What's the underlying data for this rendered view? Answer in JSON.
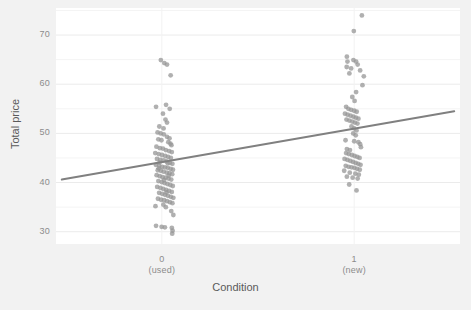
{
  "chart_data": {
    "type": "scatter",
    "title": "",
    "xlabel": "Condition",
    "ylabel": "Total price",
    "xlim": [
      -0.55,
      1.55
    ],
    "ylim": [
      27.5,
      75.5
    ],
    "ylim_visible": [
      30,
      70
    ],
    "grid": true,
    "grid_major_y": [
      30,
      40,
      50,
      60,
      70
    ],
    "grid_minor_y": [
      35,
      45,
      55,
      65,
      75
    ],
    "legend": "none",
    "x_categories": [
      {
        "value": 0,
        "label": "0",
        "sublabel": "(used)"
      },
      {
        "value": 1,
        "label": "1",
        "sublabel": "(new)"
      }
    ],
    "y_ticks": [
      30,
      40,
      50,
      60,
      70
    ],
    "point_color": "#969696",
    "point_opacity": 0.75,
    "point_radius": 2.4,
    "line_color": "#808080",
    "line_width": 2,
    "panel_background": "#ffffff",
    "outer_background": "#f2f2f2",
    "axis_text_color": "#8c8c8c",
    "axis_title_color": "#5a5a5a",
    "regression_line": {
      "x_start": -0.52,
      "y_start": 40.6,
      "x_end": 1.52,
      "y_end": 54.5,
      "jittered": true
    },
    "series": [
      {
        "name": "used",
        "x_center": 0,
        "jitter_width": 0.09,
        "points": [
          [
            -0.005,
            64.9
          ],
          [
            0.013,
            64.3
          ],
          [
            0.027,
            64.0
          ],
          [
            0.046,
            61.8
          ],
          [
            -0.03,
            55.4
          ],
          [
            0.022,
            55.8
          ],
          [
            0.041,
            55.0
          ],
          [
            0.006,
            54.0
          ],
          [
            0.019,
            52.8
          ],
          [
            0.027,
            52.2
          ],
          [
            -0.013,
            51.4
          ],
          [
            0.009,
            51.0
          ],
          [
            -0.022,
            50.2
          ],
          [
            -0.006,
            50.0
          ],
          [
            0.01,
            49.8
          ],
          [
            0.027,
            49.3
          ],
          [
            0.04,
            49.0
          ],
          [
            -0.018,
            48.8
          ],
          [
            -0.002,
            48.6
          ],
          [
            0.034,
            48.2
          ],
          [
            0.05,
            47.6
          ],
          [
            -0.028,
            47.3
          ],
          [
            -0.01,
            47.0
          ],
          [
            0.006,
            46.9
          ],
          [
            0.021,
            46.6
          ],
          [
            0.038,
            46.4
          ],
          [
            0.052,
            46.2
          ],
          [
            -0.034,
            46.0
          ],
          [
            -0.016,
            45.8
          ],
          [
            0.001,
            45.6
          ],
          [
            0.018,
            45.4
          ],
          [
            0.033,
            45.2
          ],
          [
            0.047,
            45.0
          ],
          [
            -0.025,
            44.8
          ],
          [
            -0.008,
            44.6
          ],
          [
            0.009,
            44.5
          ],
          [
            0.025,
            44.3
          ],
          [
            0.042,
            44.0
          ],
          [
            0.055,
            43.8
          ],
          [
            -0.031,
            43.6
          ],
          [
            -0.014,
            43.4
          ],
          [
            0.002,
            43.2
          ],
          [
            0.017,
            43.1
          ],
          [
            0.031,
            43.0
          ],
          [
            0.046,
            42.8
          ],
          [
            0.058,
            42.6
          ],
          [
            -0.021,
            42.5
          ],
          [
            -0.005,
            42.4
          ],
          [
            0.01,
            42.2
          ],
          [
            0.026,
            42.0
          ],
          [
            0.04,
            41.9
          ],
          [
            0.054,
            41.7
          ],
          [
            -0.027,
            41.5
          ],
          [
            -0.011,
            41.3
          ],
          [
            0.004,
            41.1
          ],
          [
            0.02,
            41.0
          ],
          [
            0.035,
            40.8
          ],
          [
            0.049,
            40.6
          ],
          [
            -0.018,
            40.3
          ],
          [
            -0.001,
            40.1
          ],
          [
            0.014,
            39.9
          ],
          [
            0.029,
            39.7
          ],
          [
            0.044,
            39.5
          ],
          [
            0.057,
            39.3
          ],
          [
            -0.024,
            39.1
          ],
          [
            -0.007,
            38.9
          ],
          [
            0.008,
            38.7
          ],
          [
            0.023,
            38.5
          ],
          [
            0.038,
            38.3
          ],
          [
            0.052,
            38.1
          ],
          [
            -0.014,
            37.9
          ],
          [
            0.002,
            37.7
          ],
          [
            0.017,
            37.5
          ],
          [
            0.032,
            37.3
          ],
          [
            0.047,
            37.1
          ],
          [
            0.06,
            36.9
          ],
          [
            -0.02,
            36.7
          ],
          [
            -0.004,
            36.5
          ],
          [
            0.012,
            36.4
          ],
          [
            0.027,
            36.2
          ],
          [
            0.042,
            36.0
          ],
          [
            0.055,
            35.8
          ],
          [
            -0.033,
            35.2
          ],
          [
            0.021,
            35.0
          ],
          [
            0.049,
            34.2
          ],
          [
            0.06,
            33.4
          ],
          [
            -0.03,
            31.2
          ],
          [
            -0.001,
            31.0
          ],
          [
            0.016,
            30.9
          ],
          [
            0.052,
            30.8
          ],
          [
            0.056,
            30.2
          ],
          [
            0.054,
            29.6
          ],
          [
            0.031,
            43.9
          ],
          [
            -0.016,
            42.9
          ],
          [
            0.036,
            41.4
          ],
          [
            0.012,
            40.5
          ],
          [
            0.045,
            47.9
          ],
          [
            -0.012,
            44.1
          ],
          [
            0.024,
            38.0
          ],
          [
            0.008,
            35.5
          ]
        ]
      },
      {
        "name": "new",
        "x_center": 1,
        "jitter_width": 0.09,
        "points": [
          [
            1.04,
            74.0
          ],
          [
            0.998,
            70.8
          ],
          [
            0.962,
            65.6
          ],
          [
            0.965,
            64.6
          ],
          [
            0.996,
            64.9
          ],
          [
            1.01,
            64.6
          ],
          [
            1.018,
            64.0
          ],
          [
            0.961,
            63.5
          ],
          [
            0.984,
            63.2
          ],
          [
            1.031,
            62.8
          ],
          [
            0.975,
            62.2
          ],
          [
            1.05,
            61.6
          ],
          [
            1.043,
            59.8
          ],
          [
            1.01,
            58.4
          ],
          [
            0.99,
            57.4
          ],
          [
            1.002,
            56.6
          ],
          [
            0.958,
            55.4
          ],
          [
            0.97,
            55.0
          ],
          [
            0.984,
            54.8
          ],
          [
            1.0,
            54.6
          ],
          [
            1.013,
            54.4
          ],
          [
            0.952,
            54.0
          ],
          [
            0.966,
            53.8
          ],
          [
            0.981,
            53.6
          ],
          [
            0.996,
            53.4
          ],
          [
            1.009,
            53.2
          ],
          [
            1.022,
            53.0
          ],
          [
            0.96,
            52.8
          ],
          [
            0.975,
            52.6
          ],
          [
            0.99,
            52.4
          ],
          [
            1.004,
            52.2
          ],
          [
            1.017,
            52.0
          ],
          [
            0.986,
            51.4
          ],
          [
            1.0,
            51.0
          ],
          [
            1.012,
            50.6
          ],
          [
            0.995,
            50.0
          ],
          [
            1.008,
            49.6
          ],
          [
            0.955,
            48.6
          ],
          [
            1.0,
            48.4
          ],
          [
            1.022,
            48.2
          ],
          [
            1.031,
            47.8
          ],
          [
            1.035,
            47.2
          ],
          [
            0.962,
            46.8
          ],
          [
            0.978,
            46.6
          ],
          [
            0.958,
            46.0
          ],
          [
            0.972,
            45.8
          ],
          [
            0.988,
            45.6
          ],
          [
            1.002,
            45.4
          ],
          [
            1.016,
            45.2
          ],
          [
            1.028,
            45.0
          ],
          [
            0.95,
            44.8
          ],
          [
            0.965,
            44.6
          ],
          [
            0.98,
            44.4
          ],
          [
            0.994,
            44.2
          ],
          [
            1.008,
            44.0
          ],
          [
            1.021,
            43.8
          ],
          [
            1.033,
            43.6
          ],
          [
            0.956,
            43.4
          ],
          [
            0.971,
            43.2
          ],
          [
            0.986,
            43.1
          ],
          [
            1.001,
            43.0
          ],
          [
            1.015,
            42.8
          ],
          [
            1.029,
            42.6
          ],
          [
            0.948,
            42.4
          ],
          [
            0.977,
            42.0
          ],
          [
            1.006,
            41.8
          ],
          [
            1.024,
            41.6
          ],
          [
            0.962,
            41.2
          ],
          [
            0.992,
            41.0
          ],
          [
            1.018,
            40.8
          ],
          [
            0.974,
            39.6
          ],
          [
            1.012,
            38.4
          ]
        ]
      }
    ]
  }
}
